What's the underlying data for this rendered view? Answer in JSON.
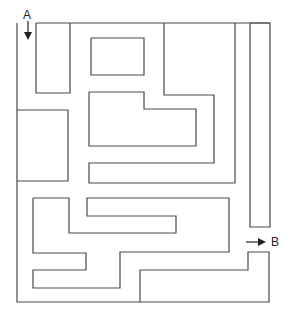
{
  "start": {
    "label": "A",
    "arrow": "down"
  },
  "end": {
    "label": "B",
    "arrow": "right"
  },
  "colors": {
    "wall": "#4a4a4a",
    "background": "#ffffff",
    "text": "#222222"
  },
  "walls": [
    {
      "id": "outer-left-bottom",
      "points": "17,23 17,302 269,302 269,252 248,252 248,270 140,270 140,302"
    },
    {
      "id": "top-edge",
      "points": "36,23 270,23"
    },
    {
      "id": "start-pillar",
      "points": "36,23 36,93 70,93 70,23"
    },
    {
      "id": "small-rect",
      "points": "91,38 144,38 144,75 91,75 91,38"
    },
    {
      "id": "l-block",
      "points": "89,92 144,92 144,109 196,109 196,146 89,146 89,92"
    },
    {
      "id": "hook-wall",
      "points": "164,23 164,95 214,95 214,163 89,163 89,183 235,183 235,23"
    },
    {
      "id": "right-bar",
      "points": "250,23 270,23 270,227 250,227 250,23"
    },
    {
      "id": "left-box",
      "points": "17,110 68,110 68,181 17,181"
    },
    {
      "id": "s-block",
      "points": "33,198 69,198 69,233 176,233 176,216 87,216 87,198 229,198 229,252 120,252 120,288 33,288 33,270 86,270 86,253 33,253 33,198"
    }
  ]
}
